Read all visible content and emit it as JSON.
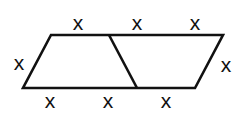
{
  "diagram": {
    "type": "geometry",
    "stroke_color": "#111111",
    "labels": {
      "top": [
        "x",
        "x",
        "x"
      ],
      "left": "x",
      "right": "x",
      "bottom": [
        "x",
        "x",
        "x"
      ]
    }
  }
}
